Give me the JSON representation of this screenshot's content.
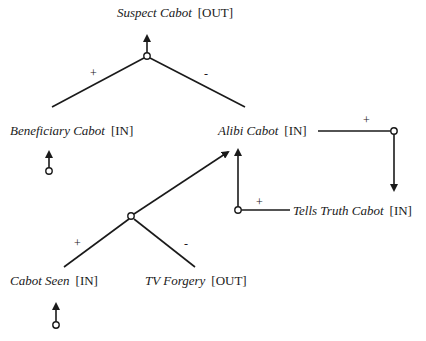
{
  "nodes": [
    {
      "id": "suspect",
      "name": "Suspect Cabot",
      "status": "[OUT]"
    },
    {
      "id": "beneficiary",
      "name": "Beneficiary Cabot",
      "status": "[IN]"
    },
    {
      "id": "alibi",
      "name": "Alibi Cabot",
      "status": "[IN]"
    },
    {
      "id": "tells_truth",
      "name": "Tells Truth Cabot",
      "status": "[IN]"
    },
    {
      "id": "cabot_seen",
      "name": "Cabot Seen",
      "status": "[IN]"
    },
    {
      "id": "tv_forgery",
      "name": "TV Forgery",
      "status": "[OUT]"
    }
  ],
  "signs": {
    "suspect_plus": "+",
    "suspect_minus": "-",
    "alibi_tt_plus": "+",
    "tt_alibi_plus": "+",
    "alibi_seen_plus": "+",
    "alibi_forgery_minus": "-"
  }
}
